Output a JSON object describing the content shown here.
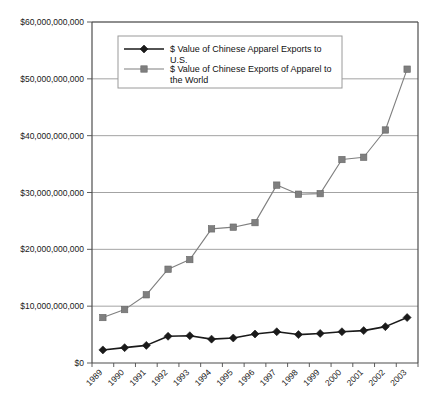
{
  "chart_data": {
    "type": "line",
    "title": "",
    "xlabel": "",
    "ylabel": "",
    "grid": true,
    "legend_position": "top-center-inside",
    "categories": [
      "1989",
      "1990",
      "1991",
      "1992",
      "1993",
      "1994",
      "1995",
      "1996",
      "1997",
      "1998",
      "1999",
      "2000",
      "2001",
      "2002",
      "2003"
    ],
    "ylim": [
      0,
      60000000000
    ],
    "ytick_values": [
      0,
      10000000000,
      20000000000,
      30000000000,
      40000000000,
      50000000000,
      60000000000
    ],
    "ytick_labels": [
      "$0",
      "$10,000,000,000",
      "$20,000,000,000",
      "$30,000,000,000",
      "$40,000,000,000",
      "$50,000,000,000",
      "$60,000,000,000"
    ],
    "series": [
      {
        "name": "$ Value of Chinese Apparel Exports to U.S.",
        "marker": "diamond",
        "color": "#1a1a1a",
        "values": [
          2300000000,
          2700000000,
          3100000000,
          4700000000,
          4800000000,
          4200000000,
          4400000000,
          5100000000,
          5500000000,
          5000000000,
          5200000000,
          5500000000,
          5700000000,
          6400000000,
          8000000000
        ]
      },
      {
        "name": "$ Value of Chinese Exports of Apparel to the World",
        "marker": "square",
        "color": "#7f7f7f",
        "values": [
          8000000000,
          9400000000,
          12000000000,
          16500000000,
          18200000000,
          23600000000,
          23900000000,
          24700000000,
          31300000000,
          29700000000,
          29800000000,
          35800000000,
          36200000000,
          41000000000,
          51700000000
        ]
      }
    ]
  },
  "legend": {
    "entries": [
      {
        "label": "$ Value of Chinese Apparel Exports to U.S.",
        "marker": "diamond"
      },
      {
        "label": "$ Value of Chinese Exports of Apparel to the World",
        "marker": "square"
      }
    ]
  },
  "colors": {
    "series1": "#1a1a1a",
    "series2": "#7f7f7f",
    "grid": "#8c8c8c",
    "axis": "#4d4d4d",
    "background": "#ffffff"
  }
}
